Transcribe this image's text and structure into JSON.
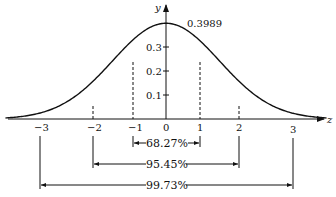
{
  "figure": {
    "x_axis_label": "z",
    "y_axis_label": "y",
    "peak_label": "0.3989",
    "x_ticks": [
      {
        "value": -3,
        "label": "−3"
      },
      {
        "value": -2,
        "label": "−2"
      },
      {
        "value": -1,
        "label": "−1"
      },
      {
        "value": 0,
        "label": "0"
      },
      {
        "value": 1,
        "label": "1"
      },
      {
        "value": 2,
        "label": "2"
      },
      {
        "value": 3,
        "label": "3"
      }
    ],
    "y_ticks": [
      {
        "value": 0.1,
        "label": "0.1"
      },
      {
        "value": 0.2,
        "label": "0.2"
      },
      {
        "value": 0.3,
        "label": "0.3"
      }
    ],
    "intervals": [
      {
        "range": [
          -1,
          1
        ],
        "label": "68.27%"
      },
      {
        "range": [
          -2,
          2
        ],
        "label": "95.45%"
      },
      {
        "range": [
          -3,
          3
        ],
        "label": "99.73%"
      }
    ],
    "colors": {
      "line": "#111111",
      "background": "#ffffff"
    }
  }
}
